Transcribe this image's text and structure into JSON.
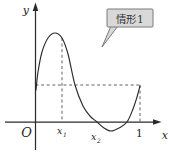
{
  "figure": {
    "labels": {
      "y_axis": "y",
      "x_axis": "x",
      "origin": "O",
      "x1_base": "x",
      "x1_sub": "1",
      "x2_base": "x",
      "x2_sub": "2",
      "one": "1"
    },
    "callout": {
      "text": "情形1"
    },
    "colors": {
      "ink": "#2b2b2b",
      "dashed": "#444444",
      "callout_fill": "#d9d9d9",
      "callout_border": "#7a7a7a",
      "background": "#ffffff"
    }
  },
  "chart_data": {
    "type": "line",
    "title": "情形1",
    "xlabel": "x",
    "ylabel": "y",
    "grid": false,
    "legend": "none",
    "x_axis_marks": [
      {
        "label": "O",
        "x": 0
      },
      {
        "label": "x1",
        "x": 0.25
      },
      {
        "label": "x2",
        "x": 0.59
      },
      {
        "label": "1",
        "x": 1.0
      }
    ],
    "key_features": {
      "y_intercept": 0.35,
      "value_at_1": 0.35,
      "equal_values_note": "f(0) = f(1), marked by horizontal dashed line",
      "local_max": {
        "x": 0.19,
        "y": 0.85
      },
      "local_min": {
        "x": 0.72,
        "y": -0.09
      },
      "zeros": [
        0.59,
        0.88
      ],
      "dashed_guides": [
        "y = f(0) from y-axis to x = 1",
        "x = x1 from curve to x-axis",
        "x = 1 from f(0)-level to x-axis"
      ]
    },
    "series": [
      {
        "name": "f(x)",
        "points_unit": [
          [
            0.005,
            0.31
          ],
          [
            0.02,
            0.48
          ],
          [
            0.06,
            0.67
          ],
          [
            0.12,
            0.8
          ],
          [
            0.19,
            0.85
          ],
          [
            0.25,
            0.8
          ],
          [
            0.31,
            0.65
          ],
          [
            0.38,
            0.35
          ],
          [
            0.46,
            0.15
          ],
          [
            0.52,
            0.06
          ],
          [
            0.59,
            0.0
          ],
          [
            0.66,
            -0.06
          ],
          [
            0.72,
            -0.09
          ],
          [
            0.8,
            -0.06
          ],
          [
            0.88,
            0.0
          ],
          [
            0.93,
            0.12
          ],
          [
            0.97,
            0.24
          ],
          [
            1.0,
            0.34
          ]
        ]
      }
    ],
    "render": {
      "origin_px": [
        35.5,
        122
      ],
      "unit_px": 104.5,
      "curve_points_px": [
        [
          36,
          90
        ],
        [
          38,
          72
        ],
        [
          42,
          52
        ],
        [
          48,
          38
        ],
        [
          55,
          33
        ],
        [
          62,
          38
        ],
        [
          68,
          54
        ],
        [
          75,
          85
        ],
        [
          83,
          106
        ],
        [
          90,
          116
        ],
        [
          97,
          122
        ],
        [
          104,
          128
        ],
        [
          111,
          131
        ],
        [
          119,
          128
        ],
        [
          127,
          122
        ],
        [
          133,
          109
        ],
        [
          137,
          97
        ],
        [
          140,
          86
        ]
      ],
      "guides_px": [
        {
          "name": "dashed-guide-f0-level",
          "from": [
            35.5,
            85
          ],
          "to": [
            140,
            85
          ]
        },
        {
          "name": "dashed-guide-x1",
          "from": [
            62,
            38
          ],
          "to": [
            62,
            122
          ]
        },
        {
          "name": "dashed-guide-at-1",
          "from": [
            140,
            85
          ],
          "to": [
            140,
            122
          ]
        }
      ]
    }
  }
}
